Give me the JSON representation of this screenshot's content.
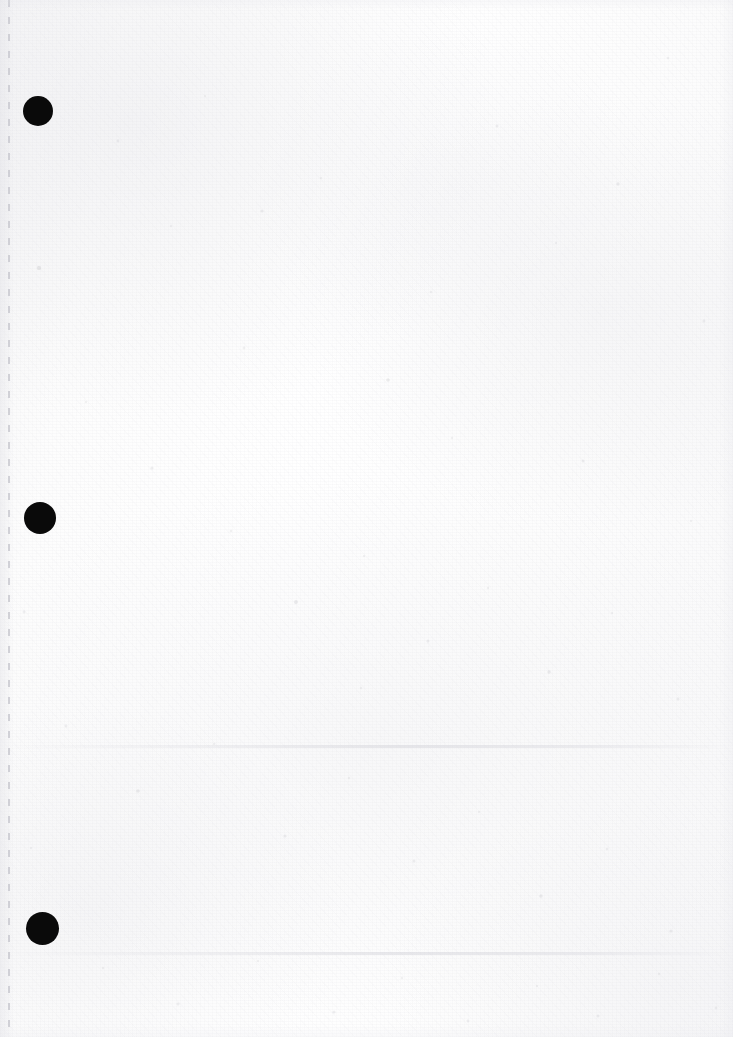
{
  "document": {
    "kind": "scanned-blank-page",
    "page_width": 733,
    "page_height": 1037,
    "visible_text": "",
    "background_color": "#fcfcfc",
    "paper_tone": "#fdfdfd"
  },
  "marks": {
    "ink_color": "#0a0a0a",
    "punch_holes": [
      {
        "label": "hole-top",
        "cx": 38,
        "cy": 111,
        "diameter": 30
      },
      {
        "label": "hole-middle",
        "cx": 40,
        "cy": 518,
        "diameter": 32
      },
      {
        "label": "hole-bottom",
        "cx": 42,
        "cy": 928,
        "diameter": 33
      }
    ],
    "perforation_line": {
      "label": "left-margin-perforation",
      "x": 8,
      "y_start": 0,
      "y_end": 1037,
      "color": "#c6c6cd",
      "dash_length": 7,
      "gap_length": 10
    },
    "creases": [
      {
        "label": "upper-crease",
        "y": 745,
        "color": "#d6d6dc"
      },
      {
        "label": "lower-crease",
        "y": 952,
        "color": "#e0e0e6"
      }
    ]
  },
  "speckles": [
    {
      "x": 39,
      "y": 268,
      "r": 2.2,
      "o": 0.22
    },
    {
      "x": 118,
      "y": 141,
      "r": 1.4,
      "o": 0.16
    },
    {
      "x": 205,
      "y": 96,
      "r": 1.1,
      "o": 0.14
    },
    {
      "x": 262,
      "y": 211,
      "r": 1.6,
      "o": 0.18
    },
    {
      "x": 321,
      "y": 178,
      "r": 1.2,
      "o": 0.13
    },
    {
      "x": 388,
      "y": 380,
      "r": 1.8,
      "o": 0.2
    },
    {
      "x": 431,
      "y": 292,
      "r": 1.3,
      "o": 0.15
    },
    {
      "x": 497,
      "y": 126,
      "r": 1.5,
      "o": 0.17
    },
    {
      "x": 556,
      "y": 243,
      "r": 1.2,
      "o": 0.13
    },
    {
      "x": 618,
      "y": 184,
      "r": 1.7,
      "o": 0.19
    },
    {
      "x": 668,
      "y": 58,
      "r": 1.3,
      "o": 0.15
    },
    {
      "x": 704,
      "y": 321,
      "r": 1.4,
      "o": 0.16
    },
    {
      "x": 86,
      "y": 402,
      "r": 1.2,
      "o": 0.13
    },
    {
      "x": 152,
      "y": 468,
      "r": 1.6,
      "o": 0.18
    },
    {
      "x": 231,
      "y": 531,
      "r": 1.3,
      "o": 0.15
    },
    {
      "x": 296,
      "y": 602,
      "r": 1.9,
      "o": 0.21
    },
    {
      "x": 364,
      "y": 556,
      "r": 1.2,
      "o": 0.13
    },
    {
      "x": 428,
      "y": 641,
      "r": 1.5,
      "o": 0.17
    },
    {
      "x": 488,
      "y": 588,
      "r": 1.3,
      "o": 0.14
    },
    {
      "x": 549,
      "y": 672,
      "r": 1.7,
      "o": 0.19
    },
    {
      "x": 612,
      "y": 613,
      "r": 1.2,
      "o": 0.13
    },
    {
      "x": 678,
      "y": 699,
      "r": 1.5,
      "o": 0.17
    },
    {
      "x": 66,
      "y": 726,
      "r": 1.4,
      "o": 0.16
    },
    {
      "x": 138,
      "y": 791,
      "r": 1.8,
      "o": 0.2
    },
    {
      "x": 214,
      "y": 744,
      "r": 1.2,
      "o": 0.13
    },
    {
      "x": 285,
      "y": 836,
      "r": 1.6,
      "o": 0.18
    },
    {
      "x": 349,
      "y": 778,
      "r": 1.3,
      "o": 0.14
    },
    {
      "x": 414,
      "y": 861,
      "r": 1.5,
      "o": 0.17
    },
    {
      "x": 479,
      "y": 812,
      "r": 1.2,
      "o": 0.13
    },
    {
      "x": 541,
      "y": 896,
      "r": 1.7,
      "o": 0.19
    },
    {
      "x": 607,
      "y": 849,
      "r": 1.3,
      "o": 0.15
    },
    {
      "x": 671,
      "y": 931,
      "r": 1.6,
      "o": 0.18
    },
    {
      "x": 103,
      "y": 968,
      "r": 1.3,
      "o": 0.14
    },
    {
      "x": 178,
      "y": 1004,
      "r": 1.5,
      "o": 0.16
    },
    {
      "x": 258,
      "y": 961,
      "r": 1.2,
      "o": 0.13
    },
    {
      "x": 334,
      "y": 1012,
      "r": 1.6,
      "o": 0.18
    },
    {
      "x": 402,
      "y": 978,
      "r": 1.3,
      "o": 0.14
    },
    {
      "x": 468,
      "y": 1021,
      "r": 1.4,
      "o": 0.16
    },
    {
      "x": 537,
      "y": 986,
      "r": 1.2,
      "o": 0.13
    },
    {
      "x": 598,
      "y": 1016,
      "r": 1.5,
      "o": 0.17
    },
    {
      "x": 659,
      "y": 974,
      "r": 1.3,
      "o": 0.14
    },
    {
      "x": 716,
      "y": 1008,
      "r": 1.4,
      "o": 0.15
    },
    {
      "x": 24,
      "y": 612,
      "r": 1.4,
      "o": 0.16
    },
    {
      "x": 31,
      "y": 848,
      "r": 1.2,
      "o": 0.13
    },
    {
      "x": 452,
      "y": 438,
      "r": 1.3,
      "o": 0.14
    },
    {
      "x": 583,
      "y": 461,
      "r": 1.5,
      "o": 0.17
    },
    {
      "x": 691,
      "y": 521,
      "r": 1.2,
      "o": 0.13
    },
    {
      "x": 244,
      "y": 348,
      "r": 1.4,
      "o": 0.15
    },
    {
      "x": 171,
      "y": 226,
      "r": 1.2,
      "o": 0.13
    },
    {
      "x": 361,
      "y": 688,
      "r": 1.3,
      "o": 0.14
    }
  ]
}
